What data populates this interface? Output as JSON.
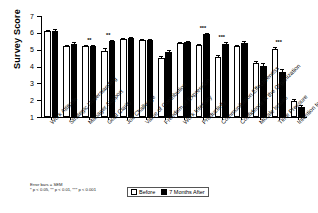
{
  "chart_data": {
    "type": "bar",
    "title": "",
    "xlabel": "",
    "ylabel": "Survey Score",
    "ylim": [
      1,
      7
    ],
    "yticks": [
      1,
      2,
      3,
      4,
      5,
      6,
      7
    ],
    "grid": false,
    "legend_position": "bottom-center",
    "categories": [
      "Work Attitude",
      "Strategic Understanding",
      "Manager Support",
      "Goal Clarity",
      "Job Challenge",
      "Value of Contribution",
      "Freedom of Expression",
      "Work Intensity",
      "Productivity",
      "Communication Effectiveness",
      "Confidence in the Organization",
      "Morale Issues",
      "Time Pressure",
      "Intention to Quit"
    ],
    "series": [
      {
        "name": "Before",
        "values": [
          6.1,
          5.22,
          5.2,
          4.95,
          5.62,
          5.55,
          4.52,
          5.38,
          5.28,
          4.58,
          5.2,
          4.2,
          5.05,
          1.95
        ],
        "errors": [
          0.08,
          0.08,
          0.07,
          0.12,
          0.06,
          0.07,
          0.12,
          0.07,
          0.08,
          0.11,
          0.09,
          0.14,
          0.12,
          0.14
        ]
      },
      {
        "name": "7 Months After",
        "values": [
          6.13,
          5.36,
          5.22,
          5.5,
          5.68,
          5.58,
          4.85,
          5.47,
          5.92,
          5.35,
          5.41,
          4.03,
          3.68,
          1.58
        ],
        "errors": [
          0.07,
          0.08,
          0.07,
          0.09,
          0.06,
          0.07,
          0.13,
          0.07,
          0.07,
          0.12,
          0.08,
          0.17,
          0.15,
          0.13
        ]
      }
    ],
    "significance": [
      "",
      "",
      "**",
      "**",
      "",
      "",
      "",
      "",
      "***",
      "***",
      "",
      "",
      "***",
      ""
    ],
    "annotations": {
      "error_bars_note": "Error bars = SEM",
      "significance_note": "* p < 0.05, ** p < 0.01, *** p < 0.001"
    }
  },
  "legend": {
    "before_label": "Before",
    "after_label": "7 Months After"
  },
  "axis": {
    "y_title": "Survey Score"
  }
}
